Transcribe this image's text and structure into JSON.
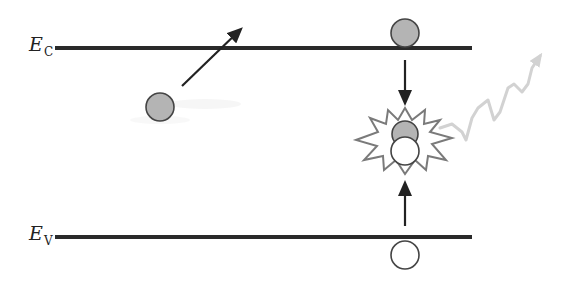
{
  "diagram": {
    "type": "band-diagram-radiative-recombination",
    "labels": {
      "conduction_band": {
        "main": "E",
        "sub": "C"
      },
      "valence_band": {
        "main": "E",
        "sub": "V"
      }
    },
    "colors": {
      "band_line": "#2a2a2a",
      "arrow": "#222222",
      "electron_fill": "#b4b4b4",
      "electron_stroke": "#444444",
      "hole_fill": "#ffffff",
      "hole_stroke": "#444444",
      "burst_stroke": "#7a7a7a",
      "photon": "#cfcfcf"
    },
    "elements": [
      {
        "id": "conduction-band",
        "kind": "line",
        "y": 48,
        "x1": 55,
        "x2": 472
      },
      {
        "id": "valence-band",
        "kind": "line",
        "y": 237,
        "x1": 55,
        "x2": 472
      },
      {
        "id": "excited-electron",
        "kind": "electron",
        "cx": 160,
        "cy": 107,
        "r": 14
      },
      {
        "id": "excitation-arrow",
        "kind": "arrow",
        "from": [
          182,
          86
        ],
        "to": [
          243,
          27
        ]
      },
      {
        "id": "cb-electron",
        "kind": "electron",
        "cx": 405,
        "cy": 33,
        "r": 14
      },
      {
        "id": "electron-down-arrow",
        "kind": "arrow",
        "from": [
          405,
          60
        ],
        "to": [
          405,
          105
        ]
      },
      {
        "id": "recombination-burst",
        "kind": "burst",
        "cx": 405,
        "cy": 142
      },
      {
        "id": "recombining-electron",
        "kind": "electron",
        "cx": 405,
        "cy": 134,
        "r": 13
      },
      {
        "id": "recombining-hole",
        "kind": "hole",
        "cx": 405,
        "cy": 150,
        "r": 14
      },
      {
        "id": "hole-up-arrow",
        "kind": "arrow",
        "from": [
          405,
          225
        ],
        "to": [
          405,
          180
        ]
      },
      {
        "id": "vb-hole",
        "kind": "hole",
        "cx": 405,
        "cy": 255,
        "r": 14
      },
      {
        "id": "emitted-photon",
        "kind": "wavy-arrow",
        "from": [
          445,
          130
        ],
        "to": [
          545,
          50
        ]
      }
    ]
  }
}
